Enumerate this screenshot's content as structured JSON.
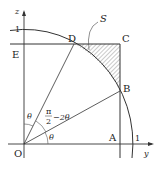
{
  "diagram": {
    "points": {
      "O": "O",
      "A": "A",
      "B": "B",
      "C": "C",
      "D": "D",
      "E": "E"
    },
    "axes": {
      "horizontal": "y",
      "vertical": "z"
    },
    "ticks": {
      "y_one": "1",
      "z_one": "1"
    },
    "region_label": "S",
    "angles": {
      "bottom": "θ",
      "top": "θ",
      "middle_num": "π",
      "middle_den": "2",
      "middle_rest": "−2θ"
    },
    "colors": {
      "line": "#333333",
      "hatch": "#555555"
    }
  }
}
